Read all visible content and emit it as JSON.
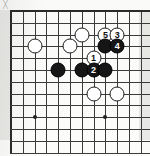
{
  "diagram": {
    "type": "go-board-diagram",
    "corner_mark": "╳",
    "board": {
      "columns": 12,
      "rows": 12,
      "origin_x": 11,
      "origin_y": 11,
      "spacing": 11.8,
      "line_color": "#3b3b3b",
      "edge_color": "#2a2a2a",
      "background_color": "#fdfdfb"
    },
    "star_points": [
      {
        "col": 2,
        "row": 9
      },
      {
        "col": 8,
        "row": 9
      }
    ],
    "stones": [
      {
        "color": "white",
        "col": 2,
        "row": 3,
        "label": ""
      },
      {
        "color": "white",
        "col": 5,
        "row": 3,
        "label": ""
      },
      {
        "color": "white",
        "col": 6,
        "row": 2,
        "label": ""
      },
      {
        "color": "white",
        "col": 8,
        "row": 2,
        "label": "5"
      },
      {
        "color": "white",
        "col": 9,
        "row": 2,
        "label": "3"
      },
      {
        "color": "black",
        "col": 8,
        "row": 3,
        "label": ""
      },
      {
        "color": "black",
        "col": 9,
        "row": 3,
        "label": "4"
      },
      {
        "color": "white",
        "col": 7,
        "row": 4,
        "label": "1"
      },
      {
        "color": "black",
        "col": 4,
        "row": 5,
        "label": ""
      },
      {
        "color": "black",
        "col": 6,
        "row": 5,
        "label": ""
      },
      {
        "color": "black",
        "col": 7,
        "row": 5,
        "label": "2"
      },
      {
        "color": "black",
        "col": 8,
        "row": 5,
        "label": ""
      },
      {
        "color": "white",
        "col": 7,
        "row": 7,
        "label": ""
      },
      {
        "color": "white",
        "col": 9,
        "row": 7,
        "label": ""
      }
    ],
    "move_sequence": [
      {
        "number": "1",
        "color": "white"
      },
      {
        "number": "2",
        "color": "black"
      },
      {
        "number": "3",
        "color": "white"
      },
      {
        "number": "4",
        "color": "black"
      },
      {
        "number": "5",
        "color": "white"
      }
    ]
  }
}
